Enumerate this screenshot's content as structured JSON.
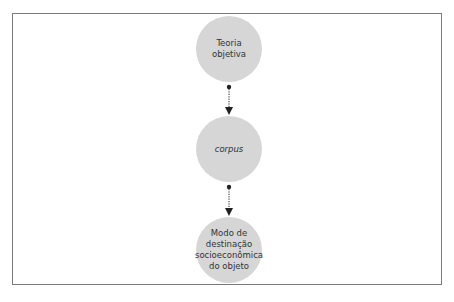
{
  "diagram": {
    "type": "vertical-flow",
    "colors": {
      "node_fill": "#d6d6d6",
      "frame": "#7a7a7a",
      "arrow": "#222222",
      "text": "#333333"
    },
    "nodes": [
      {
        "id": "teoria",
        "label_lines": [
          "Teoria",
          "objetiva"
        ],
        "italic": false
      },
      {
        "id": "corpus",
        "label_lines": [
          "corpus"
        ],
        "italic": true
      },
      {
        "id": "modo",
        "label_lines": [
          "Modo de",
          "destinação",
          "socioeconômica",
          "do objeto"
        ],
        "italic": false
      }
    ],
    "edges": [
      {
        "from": "teoria",
        "to": "corpus",
        "style": "dotted",
        "start": "dot",
        "end": "arrowhead"
      },
      {
        "from": "corpus",
        "to": "modo",
        "style": "dotted",
        "start": "dot",
        "end": "arrowhead"
      }
    ]
  }
}
